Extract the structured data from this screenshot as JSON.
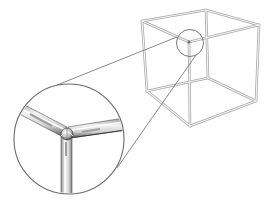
{
  "figure": {
    "colors": {
      "background": "#ffffff",
      "rod_outline": "#9a9a9a",
      "rod_fill": "#f2f2f2",
      "magnifier_line": "#6a6a6a",
      "joint_dark": "#4a4a4a",
      "rod_shade": "#bdbdbd"
    },
    "cube": {
      "vertices": {
        "top_left": [
          142,
          21
        ],
        "top_back": [
          206,
          10
        ],
        "top_right": [
          259,
          25
        ],
        "top_front": [
          189,
          42
        ],
        "bottom_left": [
          147,
          91
        ],
        "bottom_back": [
          208,
          78
        ],
        "bottom_right": [
          256,
          101
        ],
        "bottom_front": [
          190,
          126
        ]
      }
    },
    "magnifier": {
      "source_circle": {
        "cx": 190,
        "cy": 43,
        "r": 13.5
      },
      "detail_circle": {
        "cx": 69,
        "cy": 139,
        "r": 55
      },
      "joint_center": [
        67,
        134
      ]
    }
  }
}
